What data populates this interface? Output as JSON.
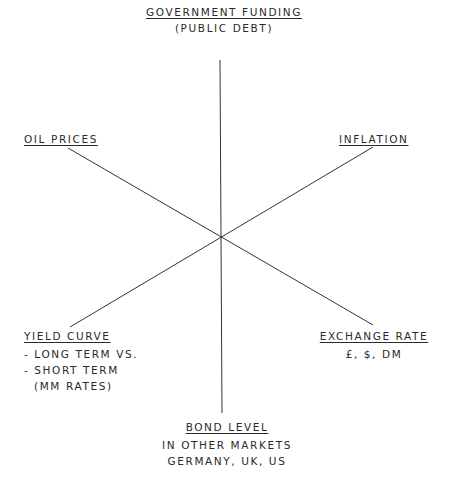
{
  "diagram": {
    "type": "radial-factor-diagram",
    "center": {
      "x": 221,
      "y": 237
    },
    "line_color": "#333333",
    "text_color": "#2a2a2a",
    "factors": {
      "top": {
        "title": "GOVERNMENT FUNDING",
        "lines": [
          "(PUBLIC DEBT)"
        ]
      },
      "upper_left": {
        "title": "OIL PRICES",
        "lines": []
      },
      "upper_right": {
        "title": "INFLATION",
        "lines": []
      },
      "lower_left": {
        "title": "YIELD CURVE",
        "lines": [
          "- LONG TERM VS.",
          "- SHORT TERM",
          "(MM RATES)"
        ]
      },
      "lower_right": {
        "title": "EXCHANGE RATE",
        "lines": [
          "£, $, DM"
        ]
      },
      "bottom": {
        "title": "BOND LEVEL",
        "lines": [
          "IN OTHER MARKETS",
          "GERMANY, UK, US"
        ]
      }
    }
  }
}
